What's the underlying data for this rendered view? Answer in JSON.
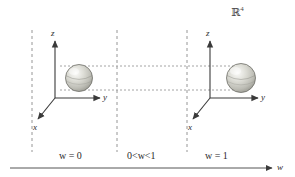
{
  "figure": {
    "title_label": "ℝ⁴",
    "space_symbol": "R",
    "space_exponent": "4",
    "colors": {
      "line": "#555555",
      "dashed": "#8a8a8a",
      "dotted": "#9a9a9a",
      "text": "#2b2b2b",
      "sphere_light": "#f0f0ee",
      "sphere_mid": "#cfcfc8",
      "sphere_dark": "#9a9a93",
      "sphere_outline": "#6e6e68"
    }
  },
  "frames": [
    {
      "name": "left-frame",
      "w_label": "w = 0",
      "w_label_prefix": "w",
      "w_label_rest": " = 0",
      "axes": {
        "z": "z",
        "y": "y",
        "x": "x"
      }
    },
    {
      "name": "right-frame",
      "w_label": "w = 1",
      "w_label_prefix": "w",
      "w_label_rest": " = 1",
      "axes": {
        "z": "z",
        "y": "y",
        "x": "x"
      }
    }
  ],
  "middle": {
    "w_label": "0<w<1",
    "w_label_pre": "0<",
    "w_label_var": "w",
    "w_label_post": "<1"
  },
  "w_axis": {
    "label": "w"
  }
}
